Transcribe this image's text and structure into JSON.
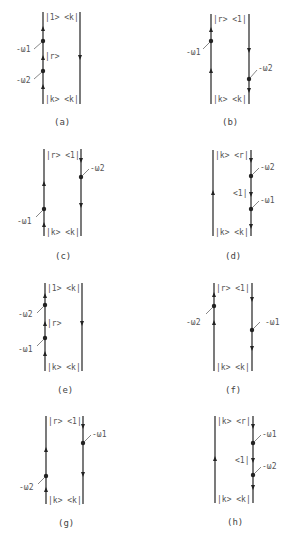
{
  "figure": {
    "panels": [
      {
        "id": "a",
        "caption": "(a)",
        "top_label": "|1> <k|",
        "bottom_label": "|k> <k|",
        "mid_label": "|r>",
        "freq_top": "-ω1",
        "freq_bottom": "-ω2"
      },
      {
        "id": "b",
        "caption": "(b)",
        "top_label": "|r> <1|",
        "bottom_label": "|k> <k|",
        "freq_left": "-ω1",
        "freq_right": "-ω2"
      },
      {
        "id": "c",
        "caption": "(c)",
        "top_label": "|r> <1|",
        "bottom_label": "|k> <k|",
        "freq_left": "-ω1",
        "freq_right": "-ω2"
      },
      {
        "id": "d",
        "caption": "(d)",
        "top_label": "|k> <r|",
        "bottom_label": "|k> <k|",
        "mid_label": "<1|",
        "freq_top": "-ω2",
        "freq_bottom": "-ω1"
      },
      {
        "id": "e",
        "caption": "(e)",
        "top_label": "|1> <k|",
        "bottom_label": "|k> <k|",
        "mid_label": "|r>",
        "freq_top": "-ω2",
        "freq_bottom": "-ω1"
      },
      {
        "id": "f",
        "caption": "(f)",
        "top_label": "|r> <1|",
        "bottom_label": "|k> <k|",
        "freq_left": "-ω2",
        "freq_right": "-ω1"
      },
      {
        "id": "g",
        "caption": "(g)",
        "top_label": "|r> <1|",
        "bottom_label": "|k> <k|",
        "freq_left": "-ω2",
        "freq_right": "-ω1"
      },
      {
        "id": "h",
        "caption": "(h)",
        "top_label": "|k> <r|",
        "bottom_label": "|k> <k|",
        "mid_label": "<1|",
        "freq_top": "-ω1",
        "freq_bottom": "-ω2"
      }
    ]
  }
}
